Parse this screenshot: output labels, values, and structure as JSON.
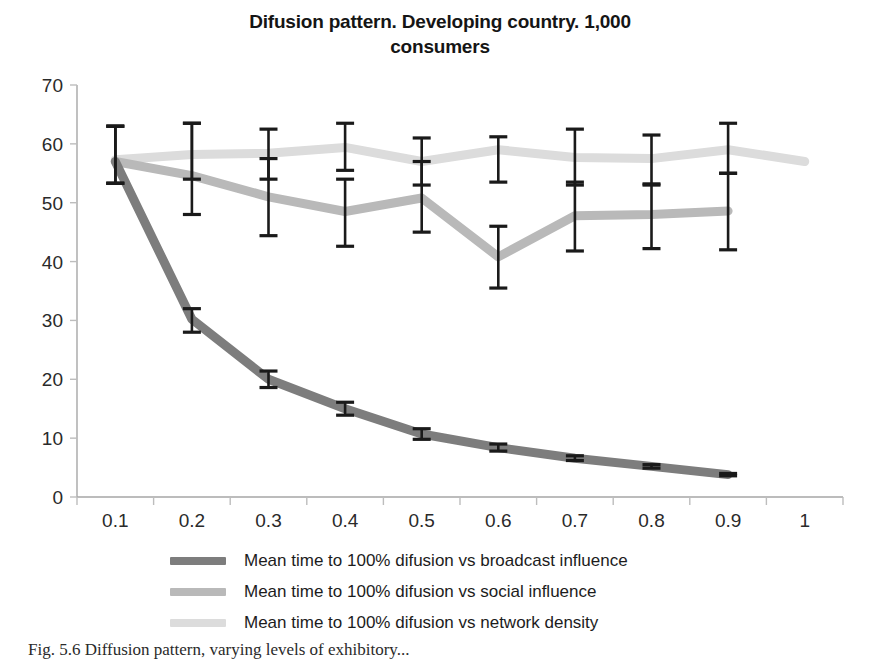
{
  "chart_data": {
    "type": "line",
    "title": "Difusion pattern. Developing country. 1,000 consumers",
    "title_line1": "Difusion pattern. Developing country. 1,000",
    "title_line2": "consumers",
    "xlabel": "",
    "ylabel": "",
    "x": [
      "0.1",
      "0.2",
      "0.3",
      "0.4",
      "0.5",
      "0.6",
      "0.7",
      "0.8",
      "0.9",
      "1"
    ],
    "xticklabels": [
      "0.1",
      "0.2",
      "0.3",
      "0.4",
      "0.5",
      "0.6",
      "0.7",
      "0.8",
      "0.9",
      "1"
    ],
    "yticklabels": [
      "0",
      "10",
      "20",
      "30",
      "40",
      "50",
      "60",
      "70"
    ],
    "ylim": [
      0,
      70
    ],
    "ytick_step": 10,
    "grid": false,
    "legend_position": "bottom",
    "error_bars": true,
    "series": [
      {
        "name": "Mean time to 100% difusion vs broadcast influence",
        "color": "#7d7d7d",
        "values": [
          57.0,
          30.2,
          20.0,
          15.0,
          10.7,
          8.4,
          6.6,
          5.2,
          3.8,
          null
        ],
        "err_low": [
          53.3,
          28.0,
          18.6,
          13.9,
          9.8,
          7.8,
          6.2,
          4.9,
          3.6,
          null
        ],
        "err_high": [
          63.0,
          32.0,
          21.4,
          16.1,
          11.6,
          9.0,
          7.0,
          5.5,
          4.0,
          null
        ]
      },
      {
        "name": "Mean time to 100% difusion vs social influence",
        "color": "#b9b9b9",
        "values": [
          57.0,
          54.6,
          51.0,
          48.5,
          50.8,
          40.8,
          47.8,
          48.0,
          48.6,
          null
        ],
        "err_low": [
          53.3,
          48.0,
          44.4,
          42.6,
          45.0,
          35.5,
          41.8,
          42.2,
          42.0,
          null
        ],
        "err_high": [
          63.0,
          63.5,
          57.5,
          54.0,
          57.0,
          46.0,
          53.5,
          53.2,
          55.0,
          null
        ]
      },
      {
        "name": "Mean time to 100% difusion vs network density",
        "color": "#dcdcdc",
        "values": [
          57.3,
          58.2,
          58.4,
          59.4,
          57.0,
          59.0,
          57.7,
          57.5,
          59.0,
          57.0
        ],
        "err_low": [
          53.3,
          54.0,
          54.0,
          55.5,
          53.0,
          53.5,
          53.0,
          53.0,
          55.0,
          null
        ],
        "err_high": [
          63.0,
          63.5,
          62.5,
          63.5,
          61.0,
          61.2,
          62.5,
          61.5,
          63.5,
          null
        ]
      }
    ]
  },
  "legend": {
    "items": [
      {
        "label": "Mean time to 100% difusion vs broadcast influence",
        "color": "#7d7d7d"
      },
      {
        "label": "Mean time to 100% difusion vs social influence",
        "color": "#b9b9b9"
      },
      {
        "label": "Mean time to 100% difusion vs network density",
        "color": "#dcdcdc"
      }
    ]
  },
  "caption": {
    "text": "Fig. 5.6  Diffusion pattern, varying levels of exhibitory..."
  },
  "axis": {
    "error_bar_color": "#1a1a1a",
    "axis_color": "#a6a6a6",
    "tick_color": "#bdbdbd"
  }
}
